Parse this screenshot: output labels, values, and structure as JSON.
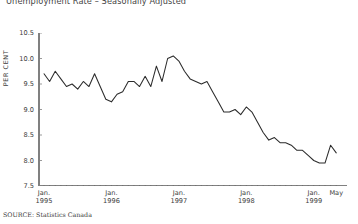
{
  "title": "Unemployment Rate – Seasonally Adjusted",
  "source": "SOURCE: Statistics Canada",
  "axis": {
    "y_label": "PER CENT",
    "y_ticks": [
      "10.5",
      "10.0",
      "9.5",
      "9.0",
      "8.5",
      "8.0",
      "7.5"
    ],
    "x_groups": [
      {
        "month": "Jan.",
        "year": "1995"
      },
      {
        "month": "Jan.",
        "year": "1996"
      },
      {
        "month": "Jan.",
        "year": "1997"
      },
      {
        "month": "Jan.",
        "year": "1998"
      },
      {
        "month": "Jan.",
        "year": "1999"
      },
      {
        "month": "May",
        "year": ""
      }
    ]
  },
  "colors": {
    "line": "#2b2b2b",
    "axis": "#808080",
    "text": "#3c3c3c",
    "background": "#ffffff"
  },
  "chart_data": {
    "type": "line",
    "title": "Unemployment Rate – Seasonally Adjusted",
    "xlabel": "",
    "ylabel": "PER CENT",
    "ylim": [
      7.5,
      10.5
    ],
    "ytick_step": 0.5,
    "grid": false,
    "legend": "none",
    "x_start": "1995-01",
    "x_end": "1999-05",
    "x_freq": "monthly",
    "x": [
      "Jan. 1995",
      "Feb. 1995",
      "Mar. 1995",
      "Apr. 1995",
      "May 1995",
      "Jun. 1995",
      "Jul. 1995",
      "Aug. 1995",
      "Sep. 1995",
      "Oct. 1995",
      "Nov. 1995",
      "Dec. 1995",
      "Jan. 1996",
      "Feb. 1996",
      "Mar. 1996",
      "Apr. 1996",
      "May 1996",
      "Jun. 1996",
      "Jul. 1996",
      "Aug. 1996",
      "Sep. 1996",
      "Oct. 1996",
      "Nov. 1996",
      "Dec. 1996",
      "Jan. 1997",
      "Feb. 1997",
      "Mar. 1997",
      "Apr. 1997",
      "May 1997",
      "Jun. 1997",
      "Jul. 1997",
      "Aug. 1997",
      "Sep. 1997",
      "Oct. 1997",
      "Nov. 1997",
      "Dec. 1997",
      "Jan. 1998",
      "Feb. 1998",
      "Mar. 1998",
      "Apr. 1998",
      "May 1998",
      "Jun. 1998",
      "Jul. 1998",
      "Aug. 1998",
      "Sep. 1998",
      "Oct. 1998",
      "Nov. 1998",
      "Dec. 1998",
      "Jan. 1999",
      "Feb. 1999",
      "Mar. 1999",
      "Apr. 1999",
      "May 1999"
    ],
    "values": [
      9.7,
      9.55,
      9.75,
      9.6,
      9.45,
      9.5,
      9.4,
      9.55,
      9.45,
      9.7,
      9.45,
      9.2,
      9.15,
      9.3,
      9.35,
      9.55,
      9.55,
      9.45,
      9.65,
      9.45,
      9.85,
      9.55,
      10.0,
      10.05,
      9.95,
      9.75,
      9.6,
      9.55,
      9.5,
      9.55,
      9.35,
      9.15,
      8.95,
      8.95,
      9.0,
      8.9,
      9.05,
      8.95,
      8.75,
      8.55,
      8.4,
      8.45,
      8.35,
      8.35,
      8.3,
      8.2,
      8.2,
      8.1,
      8.0,
      7.95,
      7.95,
      8.3,
      8.15
    ]
  }
}
